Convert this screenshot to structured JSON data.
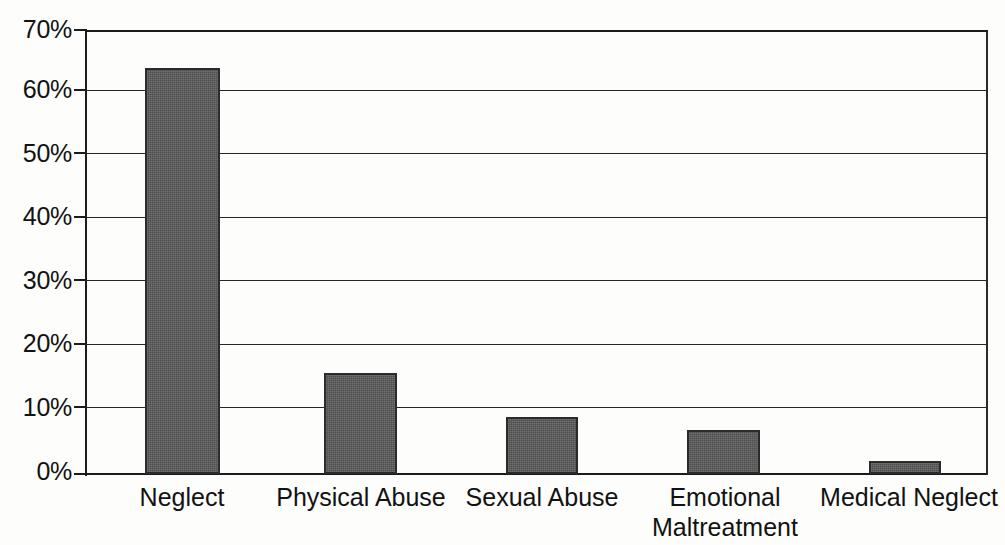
{
  "chart_data": {
    "type": "bar",
    "title": "",
    "subtitle": "",
    "xlabel": "",
    "ylabel": "",
    "categories": [
      "Neglect",
      "Physical Abuse",
      "Sexual Abuse",
      "Emotional Maltreatment",
      "Medical Neglect"
    ],
    "category_lines": [
      [
        "Neglect"
      ],
      [
        "Physical Abuse"
      ],
      [
        "Sexual Abuse"
      ],
      [
        "Emotional",
        "Maltreatment"
      ],
      [
        "Medical Neglect"
      ]
    ],
    "values": [
      64,
      16,
      9,
      7,
      2
    ],
    "value_labels": [
      "64%",
      "16%",
      "9%",
      "7%",
      "2%"
    ],
    "ylim": [
      0,
      70
    ],
    "ytick_values": [
      70,
      60,
      50,
      40,
      30,
      20,
      10,
      0
    ],
    "ytick_labels": [
      "70%",
      "60%",
      "50%",
      "40%",
      "30%",
      "20%",
      "10%",
      "0%"
    ],
    "grid": "horizontal",
    "legend": "none",
    "series": [
      {
        "name": "Percent of maltreatment type",
        "values": [
          64,
          16,
          9,
          7,
          2
        ],
        "bar_color": "#5b5b5b",
        "bar_border_color": "#2b2b2b"
      }
    ],
    "colors": {
      "bar_fill": "#5b5b5b",
      "bar_border": "#2b2b2b",
      "axis": "#1c1c1c",
      "gridline": "#262626",
      "text": "#121212",
      "background": "#fdfdfc"
    },
    "annotations": []
  }
}
